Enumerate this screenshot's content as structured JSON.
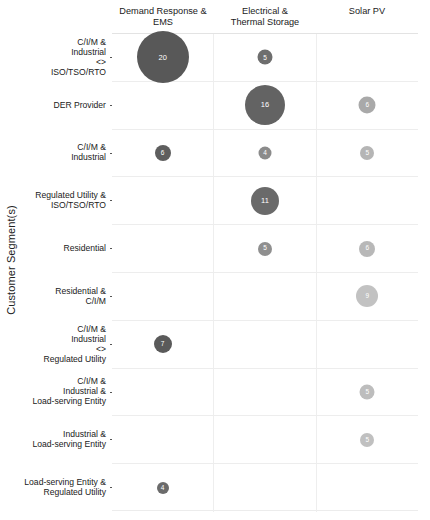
{
  "axes": {
    "y_title": "Customer Segment(s)"
  },
  "chart_data": {
    "type": "heatmap",
    "title": "",
    "xlabel": "",
    "ylabel": "Customer Segment(s)",
    "grid": true,
    "legend_position": "none",
    "categories": [
      "Demand Response &\nEMS",
      "Electrical &\nThermal Storage",
      "Solar PV"
    ],
    "rows": [
      "C/I/M &\nIndustrial\n<>\nISO/TSO/RTO",
      "DER Provider",
      "C/I/M &\nIndustrial",
      "Regulated Utility  &\nISO/TSO/RTO",
      "Residential",
      "Residential &\nC/I/M",
      "C/I/M &\nIndustrial\n<>\nRegulated Utility",
      "C/I/M &\nIndustrial &\nLoad-serving Entity",
      "Industrial &\nLoad-serving Entity",
      "Load-serving Entity &\nRegulated Utility"
    ],
    "bubbles": [
      {
        "row": 0,
        "col": 0,
        "value": 20,
        "size": 52,
        "color": "#585858"
      },
      {
        "row": 0,
        "col": 1,
        "value": 5,
        "size": 15,
        "color": "#6e6e6e"
      },
      {
        "row": 1,
        "col": 1,
        "value": 16,
        "size": 40,
        "color": "#636363"
      },
      {
        "row": 1,
        "col": 2,
        "value": 6,
        "size": 17,
        "color": "#a9a9a9"
      },
      {
        "row": 2,
        "col": 0,
        "value": 6,
        "size": 16,
        "color": "#5e5e5e"
      },
      {
        "row": 2,
        "col": 1,
        "value": 4,
        "size": 13,
        "color": "#8b8b8b"
      },
      {
        "row": 2,
        "col": 2,
        "value": 5,
        "size": 14,
        "color": "#b5b5b5"
      },
      {
        "row": 3,
        "col": 1,
        "value": 11,
        "size": 28,
        "color": "#6a6a6a"
      },
      {
        "row": 4,
        "col": 1,
        "value": 5,
        "size": 14,
        "color": "#8f8f8f"
      },
      {
        "row": 4,
        "col": 2,
        "value": 6,
        "size": 16,
        "color": "#b8b8b8"
      },
      {
        "row": 5,
        "col": 2,
        "value": 9,
        "size": 22,
        "color": "#c2c2c2"
      },
      {
        "row": 6,
        "col": 0,
        "value": 7,
        "size": 18,
        "color": "#5a5a5a"
      },
      {
        "row": 7,
        "col": 2,
        "value": 5,
        "size": 15,
        "color": "#bdbdbd"
      },
      {
        "row": 8,
        "col": 2,
        "value": 5,
        "size": 14,
        "color": "#c0c0c0"
      },
      {
        "row": 9,
        "col": 0,
        "value": 4,
        "size": 12,
        "color": "#6b6b6b"
      }
    ]
  }
}
